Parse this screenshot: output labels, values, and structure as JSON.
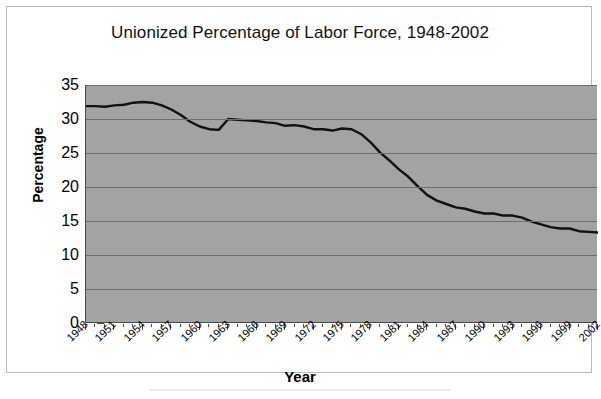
{
  "chart_data": {
    "type": "line",
    "title": "Unionized Percentage of Labor Force, 1948-2002",
    "xlabel": "Year",
    "ylabel": "Percentage",
    "ylim": [
      0,
      35
    ],
    "ytick_step": 5,
    "ytick_labels": [
      "35",
      "30",
      "25",
      "20",
      "15",
      "10",
      "5",
      "0"
    ],
    "xlim": [
      1948,
      2002
    ],
    "xtick_step": 3,
    "xtick_labels": [
      "1948",
      "1951",
      "1954",
      "1957",
      "1960",
      "1963",
      "1966",
      "1969",
      "1972",
      "1975",
      "1978",
      "1981",
      "1984",
      "1987",
      "1990",
      "1993",
      "1996",
      "1999",
      "2002"
    ],
    "grid": "horizontal",
    "legend": "none",
    "series": [
      {
        "name": "Unionized percentage of labor force",
        "color": "#111111",
        "x": [
          1948,
          1949,
          1950,
          1951,
          1952,
          1953,
          1954,
          1955,
          1956,
          1957,
          1958,
          1959,
          1960,
          1961,
          1962,
          1963,
          1964,
          1965,
          1966,
          1967,
          1968,
          1969,
          1970,
          1971,
          1972,
          1973,
          1974,
          1975,
          1976,
          1977,
          1978,
          1979,
          1980,
          1981,
          1982,
          1983,
          1984,
          1985,
          1986,
          1987,
          1988,
          1989,
          1990,
          1991,
          1992,
          1993,
          1994,
          1995,
          1996,
          1997,
          1998,
          1999,
          2000,
          2001,
          2002
        ],
        "values": [
          31.9,
          31.9,
          31.8,
          32.0,
          32.1,
          32.4,
          32.5,
          32.4,
          32.0,
          31.4,
          30.6,
          29.6,
          28.9,
          28.5,
          28.4,
          30.0,
          29.9,
          29.8,
          29.7,
          29.5,
          29.4,
          29.0,
          29.1,
          28.9,
          28.5,
          28.5,
          28.3,
          28.6,
          28.5,
          27.8,
          26.6,
          25.1,
          23.9,
          22.6,
          21.5,
          20.1,
          18.8,
          18.0,
          17.5,
          17.0,
          16.8,
          16.4,
          16.1,
          16.1,
          15.8,
          15.8,
          15.5,
          14.9,
          14.5,
          14.1,
          13.9,
          13.9,
          13.5,
          13.4,
          13.3
        ]
      }
    ]
  },
  "figure": {
    "title": "Unionized Percentage of Labor Force, 1948-2002",
    "y_axis_title": "Percentage",
    "x_axis_title": "Year"
  }
}
